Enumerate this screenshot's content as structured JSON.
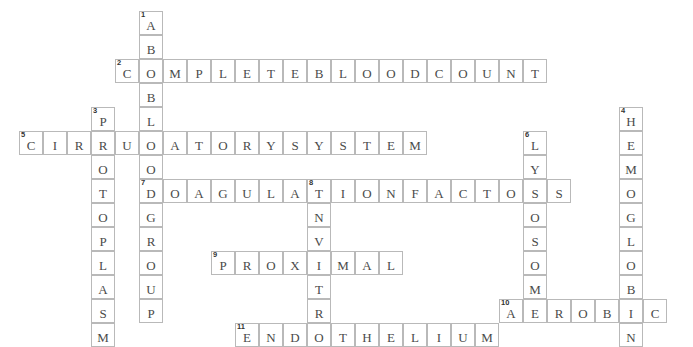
{
  "puzzle": {
    "title": "Crossword Puzzle Grid",
    "cell_size": 24,
    "origin_x": 19,
    "origin_y": 11,
    "grid_line_color": "#b9b9b9",
    "letter_color": "#4a4a4a",
    "number_color": "#333333",
    "background": "#ffffff",
    "entries": [
      {
        "number": "1",
        "direction": "down",
        "answer": "ABOBLOODGROUP",
        "length": 13,
        "col": 5,
        "row": 0
      },
      {
        "number": "2",
        "direction": "across",
        "answer": "COMPLETEBLOODCOUNT",
        "length": 18,
        "col": 4,
        "row": 2
      },
      {
        "number": "3",
        "direction": "down",
        "answer": "PROTOPLASM",
        "length": 10,
        "col": 3,
        "row": 4
      },
      {
        "number": "4",
        "direction": "down",
        "answer": "HEMOGLOBIN",
        "length": 10,
        "col": 25,
        "row": 4
      },
      {
        "number": "5",
        "direction": "across",
        "answer": "CIRCULATORYSYSTEM",
        "length": 17,
        "col": 0,
        "row": 5
      },
      {
        "number": "6",
        "direction": "down",
        "answer": "LYSOSOME",
        "length": 8,
        "col": 21,
        "row": 5
      },
      {
        "number": "7",
        "direction": "across",
        "answer": "COAGULATIONFACTORS",
        "length": 18,
        "col": 5,
        "row": 7
      },
      {
        "number": "8",
        "direction": "down",
        "answer": "INVITRO",
        "length": 7,
        "col": 12,
        "row": 7
      },
      {
        "number": "9",
        "direction": "across",
        "answer": "PROXIMAL",
        "length": 8,
        "col": 8,
        "row": 10
      },
      {
        "number": "10",
        "direction": "across",
        "answer": "AEROBIC",
        "length": 7,
        "col": 20,
        "row": 12
      },
      {
        "number": "11",
        "direction": "across",
        "answer": "ENDOTHELIUM",
        "length": 11,
        "col": 9,
        "row": 13
      }
    ]
  }
}
